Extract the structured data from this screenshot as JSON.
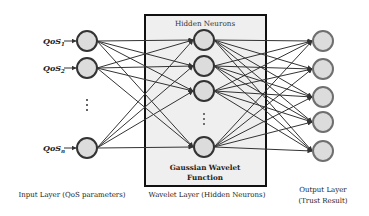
{
  "figure": {
    "type": "wavelet-neural-network",
    "box": {
      "title": "Hidden Neurons",
      "function_line1": "Gaussian Wavelet",
      "function_line2": "Function",
      "fill": "#efefef",
      "stroke": "#111111"
    },
    "input_layer": {
      "label": "Input Layer (QoS parameters)",
      "nodes": [
        {
          "id": "in1",
          "text": "QoS",
          "sub": "1"
        },
        {
          "id": "in2",
          "text": "QoS",
          "sub": "2"
        },
        {
          "id": "inn",
          "text": "QoS",
          "sub": "n"
        }
      ],
      "ellipsis": "⋮"
    },
    "hidden_layer": {
      "label": "Wavelet Layer (Hidden Neurons)",
      "node_count_shown": 4,
      "ellipsis": "⋮"
    },
    "output_layer": {
      "label_line1": "Output Layer",
      "label_line2": "(Trust Result)",
      "node_count_shown": 5
    },
    "connections": "fully connected between adjacent layers",
    "colors": {
      "node_fill": "#dcdcdc",
      "node_stroke": "#333333",
      "output_node_stroke": "#6f6f6f",
      "edge": "#333333"
    }
  }
}
